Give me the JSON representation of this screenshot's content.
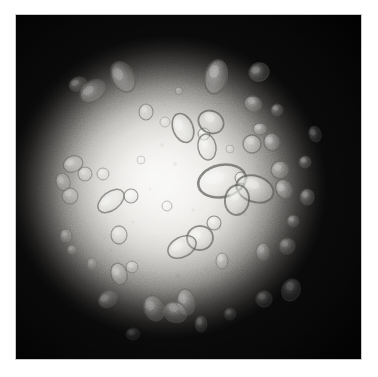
{
  "image": {
    "kind": "micrograph",
    "modality": "brightfield-microscopy",
    "color_mode": "grayscale",
    "caption": "",
    "frame": {
      "x": 15,
      "y": 14,
      "width": 347,
      "height": 346
    },
    "page_background": "#ffffff"
  },
  "illumination": {
    "type": "vignette",
    "center_x_pct": 44,
    "center_y_pct": 50,
    "core_color": "#f6f6f4",
    "mid_color": "#8a8885",
    "corner_color": "#0a0a0a",
    "field_radius_x_pct": 46,
    "field_radius_y_pct": 44,
    "grain_opacity": 0.3
  },
  "palette": {
    "background": "#ffffff",
    "field_bright": "#f6f6f4",
    "field_mid": "#b4b2ae",
    "field_dark": "#0a0a0a",
    "particle_outline": "#5d5d5a",
    "particle_fill": "#e9e8e5",
    "particle_highlight": "#fbfbfa"
  },
  "particles": {
    "count": 58,
    "description": "translucent ellipsoidal and teardrop droplets with darker refractive outlines",
    "items": [
      {
        "id": "p01",
        "cx": 108,
        "cy": 63,
        "rx": 11,
        "ry": 16,
        "rot": -28,
        "op": 0.5
      },
      {
        "id": "p02",
        "cx": 78,
        "cy": 77,
        "rx": 14,
        "ry": 10,
        "rot": -35,
        "op": 0.48
      },
      {
        "id": "p03",
        "cx": 63,
        "cy": 70,
        "rx": 9,
        "ry": 7,
        "rot": -20,
        "op": 0.42
      },
      {
        "id": "p04",
        "cx": 131,
        "cy": 98,
        "rx": 7,
        "ry": 8,
        "rot": 0,
        "op": 0.55
      },
      {
        "id": "p05",
        "cx": 201,
        "cy": 63,
        "rx": 11,
        "ry": 17,
        "rot": 12,
        "op": 0.62
      },
      {
        "id": "p06",
        "cx": 244,
        "cy": 58,
        "rx": 10,
        "ry": 9,
        "rot": -15,
        "op": 0.5
      },
      {
        "id": "p07",
        "cx": 238,
        "cy": 90,
        "rx": 9,
        "ry": 8,
        "rot": 20,
        "op": 0.52
      },
      {
        "id": "p08",
        "cx": 168,
        "cy": 114,
        "rx": 10,
        "ry": 15,
        "rot": -22,
        "op": 0.72
      },
      {
        "id": "p09",
        "cx": 189,
        "cy": 120,
        "rx": 6,
        "ry": 6,
        "rot": 0,
        "op": 0.7
      },
      {
        "id": "p10",
        "cx": 196,
        "cy": 108,
        "rx": 13,
        "ry": 11,
        "rot": 28,
        "op": 0.74
      },
      {
        "id": "p11",
        "cx": 192,
        "cy": 133,
        "rx": 9,
        "ry": 13,
        "rot": -10,
        "op": 0.7
      },
      {
        "id": "p12",
        "cx": 245,
        "cy": 115,
        "rx": 7,
        "ry": 6,
        "rot": 0,
        "op": 0.58
      },
      {
        "id": "p13",
        "cx": 237,
        "cy": 130,
        "rx": 9,
        "ry": 9,
        "rot": 15,
        "op": 0.6
      },
      {
        "id": "p14",
        "cx": 257,
        "cy": 128,
        "rx": 8,
        "ry": 9,
        "rot": -18,
        "op": 0.56
      },
      {
        "id": "p15",
        "cx": 265,
        "cy": 156,
        "rx": 9,
        "ry": 9,
        "rot": 0,
        "op": 0.52
      },
      {
        "id": "p16",
        "cx": 207,
        "cy": 167,
        "rx": 24,
        "ry": 16,
        "rot": -12,
        "op": 0.76
      },
      {
        "id": "p17",
        "cx": 226,
        "cy": 164,
        "rx": 6,
        "ry": 6,
        "rot": 0,
        "op": 0.72
      },
      {
        "id": "p18",
        "cx": 240,
        "cy": 175,
        "rx": 19,
        "ry": 13,
        "rot": 18,
        "op": 0.74
      },
      {
        "id": "p19",
        "cx": 222,
        "cy": 186,
        "rx": 12,
        "ry": 15,
        "rot": 8,
        "op": 0.74
      },
      {
        "id": "p20",
        "cx": 269,
        "cy": 175,
        "rx": 8,
        "ry": 10,
        "rot": -25,
        "op": 0.56
      },
      {
        "id": "p21",
        "cx": 292,
        "cy": 183,
        "rx": 7,
        "ry": 8,
        "rot": 0,
        "op": 0.46
      },
      {
        "id": "p22",
        "cx": 278,
        "cy": 207,
        "rx": 6,
        "ry": 6,
        "rot": 0,
        "op": 0.42
      },
      {
        "id": "p23",
        "cx": 185,
        "cy": 224,
        "rx": 13,
        "ry": 12,
        "rot": -8,
        "op": 0.7
      },
      {
        "id": "p24",
        "cx": 199,
        "cy": 209,
        "rx": 7,
        "ry": 7,
        "rot": 0,
        "op": 0.68
      },
      {
        "id": "p25",
        "cx": 167,
        "cy": 233,
        "rx": 15,
        "ry": 10,
        "rot": -28,
        "op": 0.68
      },
      {
        "id": "p26",
        "cx": 207,
        "cy": 247,
        "rx": 6,
        "ry": 8,
        "rot": 0,
        "op": 0.5
      },
      {
        "id": "p27",
        "cx": 96,
        "cy": 187,
        "rx": 15,
        "ry": 9,
        "rot": -38,
        "op": 0.66
      },
      {
        "id": "p28",
        "cx": 116,
        "cy": 182,
        "rx": 7,
        "ry": 7,
        "rot": 0,
        "op": 0.62
      },
      {
        "id": "p29",
        "cx": 152,
        "cy": 192,
        "rx": 5,
        "ry": 5,
        "rot": 0,
        "op": 0.52
      },
      {
        "id": "p30",
        "cx": 58,
        "cy": 150,
        "rx": 10,
        "ry": 8,
        "rot": -20,
        "op": 0.56
      },
      {
        "id": "p31",
        "cx": 70,
        "cy": 160,
        "rx": 7,
        "ry": 7,
        "rot": 0,
        "op": 0.5
      },
      {
        "id": "p32",
        "cx": 48,
        "cy": 168,
        "rx": 7,
        "ry": 9,
        "rot": -15,
        "op": 0.45
      },
      {
        "id": "p33",
        "cx": 55,
        "cy": 182,
        "rx": 8,
        "ry": 8,
        "rot": 10,
        "op": 0.45
      },
      {
        "id": "p34",
        "cx": 88,
        "cy": 160,
        "rx": 6,
        "ry": 6,
        "rot": 0,
        "op": 0.5
      },
      {
        "id": "p35",
        "cx": 51,
        "cy": 222,
        "rx": 6,
        "ry": 7,
        "rot": 0,
        "op": 0.38
      },
      {
        "id": "p36",
        "cx": 57,
        "cy": 236,
        "rx": 5,
        "ry": 5,
        "rot": 0,
        "op": 0.34
      },
      {
        "id": "p37",
        "cx": 104,
        "cy": 221,
        "rx": 8,
        "ry": 9,
        "rot": 0,
        "op": 0.54
      },
      {
        "id": "p38",
        "cx": 104,
        "cy": 260,
        "rx": 8,
        "ry": 11,
        "rot": -18,
        "op": 0.52
      },
      {
        "id": "p39",
        "cx": 117,
        "cy": 253,
        "rx": 6,
        "ry": 6,
        "rot": 0,
        "op": 0.5
      },
      {
        "id": "p40",
        "cx": 248,
        "cy": 238,
        "rx": 7,
        "ry": 9,
        "rot": 0,
        "op": 0.4
      },
      {
        "id": "p41",
        "cx": 272,
        "cy": 232,
        "rx": 8,
        "ry": 8,
        "rot": 0,
        "op": 0.38
      },
      {
        "id": "p42",
        "cx": 276,
        "cy": 276,
        "rx": 9,
        "ry": 11,
        "rot": 20,
        "op": 0.34
      },
      {
        "id": "p43",
        "cx": 249,
        "cy": 285,
        "rx": 8,
        "ry": 8,
        "rot": 0,
        "op": 0.3
      },
      {
        "id": "p44",
        "cx": 139,
        "cy": 294,
        "rx": 10,
        "ry": 13,
        "rot": -22,
        "op": 0.44
      },
      {
        "id": "p45",
        "cx": 171,
        "cy": 288,
        "rx": 9,
        "ry": 13,
        "rot": -10,
        "op": 0.46
      },
      {
        "id": "p46",
        "cx": 93,
        "cy": 285,
        "rx": 10,
        "ry": 8,
        "rot": -30,
        "op": 0.36
      },
      {
        "id": "p47",
        "cx": 160,
        "cy": 298,
        "rx": 12,
        "ry": 10,
        "rot": 25,
        "op": 0.44
      },
      {
        "id": "p48",
        "cx": 186,
        "cy": 310,
        "rx": 6,
        "ry": 8,
        "rot": 0,
        "op": 0.32
      },
      {
        "id": "p49",
        "cx": 290,
        "cy": 148,
        "rx": 6,
        "ry": 6,
        "rot": 0,
        "op": 0.44
      },
      {
        "id": "p50",
        "cx": 150,
        "cy": 108,
        "rx": 5,
        "ry": 5,
        "rot": 0,
        "op": 0.4
      },
      {
        "id": "p51",
        "cx": 126,
        "cy": 146,
        "rx": 4,
        "ry": 4,
        "rot": 0,
        "op": 0.34
      },
      {
        "id": "p52",
        "cx": 215,
        "cy": 135,
        "rx": 4,
        "ry": 4,
        "rot": 0,
        "op": 0.36
      },
      {
        "id": "p53",
        "cx": 262,
        "cy": 96,
        "rx": 6,
        "ry": 6,
        "rot": 0,
        "op": 0.44
      },
      {
        "id": "p54",
        "cx": 164,
        "cy": 77,
        "rx": 4,
        "ry": 4,
        "rot": 0,
        "op": 0.32
      },
      {
        "id": "p55",
        "cx": 300,
        "cy": 120,
        "rx": 6,
        "ry": 8,
        "rot": -20,
        "op": 0.34
      },
      {
        "id": "p56",
        "cx": 118,
        "cy": 320,
        "rx": 7,
        "ry": 6,
        "rot": 0,
        "op": 0.24
      },
      {
        "id": "p57",
        "cx": 215,
        "cy": 300,
        "rx": 6,
        "ry": 6,
        "rot": 0,
        "op": 0.26
      },
      {
        "id": "p58",
        "cx": 77,
        "cy": 250,
        "rx": 5,
        "ry": 6,
        "rot": 0,
        "op": 0.3
      }
    ]
  },
  "debris": {
    "description": "faint out-of-focus specks and smudges in the illuminated field",
    "items": [
      {
        "cx": 147,
        "cy": 131,
        "r": 2.5,
        "op": 0.14
      },
      {
        "cx": 160,
        "cy": 150,
        "r": 3.0,
        "op": 0.12
      },
      {
        "cx": 135,
        "cy": 175,
        "r": 2.0,
        "op": 0.13
      },
      {
        "cx": 178,
        "cy": 196,
        "r": 2.2,
        "op": 0.12
      },
      {
        "cx": 205,
        "cy": 215,
        "r": 2.0,
        "op": 0.12
      },
      {
        "cx": 230,
        "cy": 200,
        "r": 2.4,
        "op": 0.11
      },
      {
        "cx": 118,
        "cy": 208,
        "r": 2.2,
        "op": 0.13
      },
      {
        "cx": 96,
        "cy": 236,
        "r": 2.6,
        "op": 0.12
      },
      {
        "cx": 163,
        "cy": 262,
        "r": 3.2,
        "op": 0.15
      },
      {
        "cx": 190,
        "cy": 255,
        "r": 2.0,
        "op": 0.12
      },
      {
        "cx": 243,
        "cy": 152,
        "r": 2.0,
        "op": 0.12
      },
      {
        "cx": 205,
        "cy": 90,
        "r": 2.4,
        "op": 0.13
      },
      {
        "cx": 255,
        "cy": 208,
        "r": 2.2,
        "op": 0.11
      },
      {
        "cx": 128,
        "cy": 262,
        "r": 2.0,
        "op": 0.11
      },
      {
        "cx": 150,
        "cy": 90,
        "r": 2.0,
        "op": 0.1
      }
    ]
  }
}
